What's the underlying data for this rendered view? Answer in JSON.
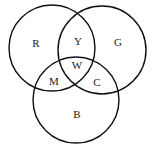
{
  "diagram": {
    "type": "venn",
    "circles": [
      {
        "name": "red",
        "cx": 52,
        "cy": 48,
        "r": 43
      },
      {
        "name": "green",
        "cx": 102,
        "cy": 50,
        "r": 44
      },
      {
        "name": "blue",
        "cx": 76,
        "cy": 100,
        "r": 43
      }
    ],
    "labels": [
      {
        "text": "R",
        "x": 36,
        "y": 44
      },
      {
        "text": "Y",
        "x": 78,
        "y": 42
      },
      {
        "text": "G",
        "x": 118,
        "y": 43
      },
      {
        "text": "W",
        "x": 77,
        "y": 66
      },
      {
        "text": "M",
        "x": 54,
        "y": 82
      },
      {
        "text": "C",
        "x": 97,
        "y": 83
      },
      {
        "text": "B",
        "x": 77,
        "y": 115
      }
    ]
  }
}
